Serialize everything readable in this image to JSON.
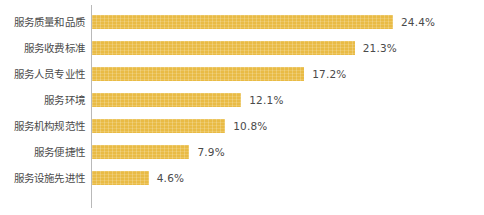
{
  "chart_data": {
    "type": "bar",
    "orientation": "horizontal",
    "title": "",
    "subtitle": "",
    "xlabel": "",
    "ylabel": "",
    "xlim": [
      0,
      27
    ],
    "grid": false,
    "legend": null,
    "value_suffix": "%",
    "bar_color": "#e9bb45",
    "axis_color": "#b9b9b9",
    "text_color": "#4a4a4a",
    "categories": [
      "服务质量和品质",
      "服务收费标准",
      "服务人员专业性",
      "服务环境",
      "服务机构规范性",
      "服务便捷性",
      "服务设施先进性"
    ],
    "values": [
      24.4,
      21.3,
      17.2,
      12.1,
      10.8,
      7.9,
      4.6
    ],
    "value_labels": [
      "24.4%",
      "21.3%",
      "17.2%",
      "12.1%",
      "10.8%",
      "7.9%",
      "4.6%"
    ]
  }
}
